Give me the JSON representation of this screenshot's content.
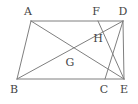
{
  "figure": {
    "type": "geometry-diagram",
    "width": 138,
    "height": 104,
    "background_color": "#ffffff",
    "line_color": "#7f7f7f",
    "label_color": "#444444",
    "line_width": 1
  },
  "points": [
    {
      "id": "A",
      "label": "A",
      "x": 31,
      "y": 21,
      "label_x": 28,
      "label_y": 11,
      "kind": "vertex"
    },
    {
      "id": "F",
      "label": "F",
      "x": 98,
      "y": 21,
      "label_x": 96,
      "label_y": 11,
      "kind": "vertex"
    },
    {
      "id": "D",
      "label": "D",
      "x": 123,
      "y": 21,
      "label_x": 123,
      "label_y": 11,
      "kind": "vertex"
    },
    {
      "id": "H",
      "label": "H",
      "x": 103,
      "y": 36,
      "label_x": 98,
      "label_y": 38,
      "kind": "intersection"
    },
    {
      "id": "G",
      "label": "G",
      "x": 70,
      "y": 55,
      "label_x": 70,
      "label_y": 62,
      "kind": "intersection"
    },
    {
      "id": "B",
      "label": "B",
      "x": 17,
      "y": 79,
      "label_x": 14,
      "label_y": 89,
      "kind": "vertex"
    },
    {
      "id": "C",
      "label": "C",
      "x": 105,
      "y": 79,
      "label_x": 104,
      "label_y": 89,
      "kind": "vertex"
    },
    {
      "id": "E",
      "label": "E",
      "x": 124,
      "y": 79,
      "label_x": 124,
      "label_y": 89,
      "kind": "vertex"
    }
  ],
  "segments": [
    {
      "id": "AD",
      "name": "segment-a-d",
      "x1": 31,
      "y1": 21,
      "x2": 123,
      "y2": 21
    },
    {
      "id": "BE",
      "name": "segment-b-e",
      "x1": 17,
      "y1": 79,
      "x2": 124,
      "y2": 79
    },
    {
      "id": "AB",
      "name": "segment-a-b",
      "x1": 31,
      "y1": 21,
      "x2": 17,
      "y2": 79
    },
    {
      "id": "DE",
      "name": "segment-d-e",
      "x1": 123,
      "y1": 21,
      "x2": 124,
      "y2": 79
    },
    {
      "id": "AE",
      "name": "diagonal-a-e",
      "x1": 31,
      "y1": 21,
      "x2": 124,
      "y2": 79
    },
    {
      "id": "BD",
      "name": "diagonal-b-d",
      "x1": 17,
      "y1": 79,
      "x2": 123,
      "y2": 21
    },
    {
      "id": "FE",
      "name": "segment-f-e",
      "x1": 98,
      "y1": 21,
      "x2": 124,
      "y2": 79
    },
    {
      "id": "DC",
      "name": "segment-d-c",
      "x1": 123,
      "y1": 21,
      "x2": 105,
      "y2": 79
    }
  ]
}
